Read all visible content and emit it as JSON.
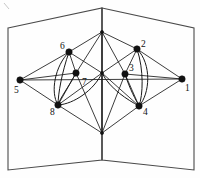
{
  "figure": {
    "background_color": "#ffffff",
    "line_color": "#1a1a1a",
    "panel_color": "#4a4a4a",
    "vertex_color": "#111111"
  },
  "surface": {
    "name": "folded-book-surface",
    "spine": {
      "top_x": 102,
      "top_y": 8,
      "bottom_x": 102,
      "bottom_y": 160
    },
    "left_panel_outline": "8,28 102,8 102,160 8,170",
    "right_panel_outline": "102,8 194,28 194,170 102,160"
  },
  "apexes": {
    "top": {
      "name": "spine-top-junction",
      "x": 102,
      "y": 32
    },
    "bottom": {
      "name": "spine-bottom-junction",
      "x": 102,
      "y": 133
    },
    "center": {
      "name": "spine-center-junction",
      "x": 102,
      "y": 73
    }
  },
  "vertices": [
    {
      "id": "1",
      "label": "1",
      "x": 182,
      "y": 79,
      "label_x": 185,
      "label_y": 91,
      "radius": 3.2
    },
    {
      "id": "2",
      "label": "2",
      "x": 137,
      "y": 49,
      "label_x": 141,
      "label_y": 47,
      "radius": 3.2
    },
    {
      "id": "3",
      "label": "3",
      "x": 125,
      "y": 74,
      "label_x": 129,
      "label_y": 71,
      "radius": 3.2
    },
    {
      "id": "4",
      "label": "4",
      "x": 139,
      "y": 106,
      "label_x": 143,
      "label_y": 115,
      "radius": 3.2
    },
    {
      "id": "5",
      "label": "5",
      "x": 20,
      "y": 80,
      "label_x": 14,
      "label_y": 93,
      "radius": 3.2
    },
    {
      "id": "6",
      "label": "6",
      "x": 69,
      "y": 52,
      "label_x": 60,
      "label_y": 49,
      "radius": 3.2
    },
    {
      "id": "7",
      "label": "7",
      "x": 76,
      "y": 73,
      "label_x": 82,
      "label_y": 85,
      "radius": 3.2
    },
    {
      "id": "8",
      "label": "8",
      "x": 58,
      "y": 105,
      "label_x": 50,
      "label_y": 115,
      "radius": 3.2
    }
  ],
  "straight_edges": [
    {
      "from": "5",
      "to": "6",
      "d": "M20,80 L69,52"
    },
    {
      "from": "5",
      "to": "8",
      "d": "M20,80 L58,105"
    },
    {
      "from": "5",
      "to": "7",
      "d": "M20,80 L76,73"
    },
    {
      "from": "5",
      "to": "1",
      "d": "M20,80 L182,79"
    },
    {
      "from": "6",
      "to": "top",
      "d": "M69,52 L102,32"
    },
    {
      "from": "6",
      "to": "7",
      "d": "M69,52 L76,73"
    },
    {
      "from": "6",
      "to": "center",
      "d": "M69,52 L102,73"
    },
    {
      "from": "7",
      "to": "8",
      "d": "M76,73 L58,105"
    },
    {
      "from": "7",
      "to": "top",
      "d": "M76,73 L102,32"
    },
    {
      "from": "7",
      "to": "bottom",
      "d": "M76,73 L102,133"
    },
    {
      "from": "8",
      "to": "bottom",
      "d": "M58,105 L102,133"
    },
    {
      "from": "8",
      "to": "center",
      "d": "M58,105 L102,73"
    },
    {
      "from": "2",
      "to": "top",
      "d": "M137,49 L102,32"
    },
    {
      "from": "2",
      "to": "3",
      "d": "M137,49 L125,74"
    },
    {
      "from": "2",
      "to": "1",
      "d": "M137,49 L182,79"
    },
    {
      "from": "2",
      "to": "center",
      "d": "M137,49 L102,73"
    },
    {
      "from": "3",
      "to": "top",
      "d": "M125,74 L102,32"
    },
    {
      "from": "3",
      "to": "bottom",
      "d": "M125,74 L102,133"
    },
    {
      "from": "3",
      "to": "4",
      "d": "M125,74 L139,106"
    },
    {
      "from": "3",
      "to": "1",
      "d": "M125,74 L182,79"
    },
    {
      "from": "4",
      "to": "bottom",
      "d": "M139,106 L102,133"
    },
    {
      "from": "4",
      "to": "1",
      "d": "M139,106 L182,79"
    },
    {
      "from": "4",
      "to": "center",
      "d": "M139,106 L102,73"
    },
    {
      "from": "top",
      "to": "center",
      "d": "M102,32 L102,73"
    },
    {
      "from": "center",
      "to": "bottom",
      "d": "M102,73 L102,133"
    }
  ],
  "curved_edges": [
    {
      "from": "6",
      "to": "8",
      "d": "M69,52 C55,66 50,92 58,105"
    },
    {
      "from": "6",
      "to": "8",
      "d": "M69,52 C62,72 58,94 58,105"
    },
    {
      "from": "7",
      "to": "8",
      "d": "M76,73 C68,88 60,98 58,105"
    },
    {
      "from": "8",
      "to": "center",
      "d": "M58,105 C74,104 94,90 102,73"
    },
    {
      "from": "2",
      "to": "4",
      "d": "M137,49 C152,64 150,94 139,106"
    },
    {
      "from": "2",
      "to": "4",
      "d": "M137,49 C144,70 143,95 139,106"
    },
    {
      "from": "3",
      "to": "4",
      "d": "M125,74 C130,90 136,100 139,106"
    },
    {
      "from": "4",
      "to": "center",
      "d": "M139,106 C128,100 110,89 102,73"
    }
  ],
  "corner_mark": {
    "name": "scan-artifact-mark",
    "d": "M4,3 L9,9"
  }
}
